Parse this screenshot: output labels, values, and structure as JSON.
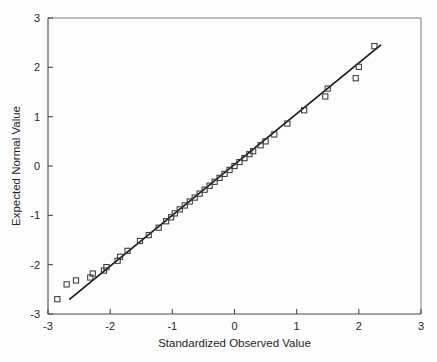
{
  "chart_data": {
    "type": "scatter",
    "title": "",
    "xlabel": "Standardized Observed Value",
    "ylabel": "Expected Normal Value",
    "xlim": [
      -3,
      3
    ],
    "ylim": [
      -3,
      3
    ],
    "xticks": [
      -3,
      -2,
      -1,
      0,
      1,
      2,
      3
    ],
    "yticks": [
      -3,
      -2,
      -1,
      0,
      1,
      2,
      3
    ],
    "xtick_labels": [
      "-3",
      "-2",
      "-1",
      "0",
      "1",
      "2",
      "3"
    ],
    "ytick_labels": [
      "-3",
      "-2",
      "-1",
      "0",
      "1",
      "2",
      "3"
    ],
    "grid": false,
    "legend": false,
    "legend_position": "none",
    "marker_style": "open-square",
    "marker_color": "#3a3a3a",
    "line_color": "#1a1a1a",
    "background_color": "#fdfdfe",
    "axis_color": "#4a4a4a",
    "reference_line": {
      "label": "normal reference line",
      "x": [
        -2.65,
        2.35
      ],
      "y": [
        -2.7,
        2.45
      ]
    },
    "series": [
      {
        "name": "Q-Q points",
        "x": [
          -2.85,
          -2.7,
          -2.55,
          -2.32,
          -2.28,
          -2.1,
          -2.06,
          -1.88,
          -1.84,
          -1.72,
          -1.52,
          -1.38,
          -1.22,
          -1.1,
          -1.02,
          -0.96,
          -0.88,
          -0.8,
          -0.72,
          -0.64,
          -0.56,
          -0.48,
          -0.4,
          -0.32,
          -0.24,
          -0.16,
          -0.08,
          0.0,
          0.08,
          0.16,
          0.24,
          0.3,
          0.42,
          0.5,
          0.64,
          0.85,
          1.12,
          1.46,
          1.5,
          1.95,
          2.0,
          2.25
        ],
        "y": [
          -2.7,
          -2.4,
          -2.32,
          -2.26,
          -2.18,
          -2.12,
          -2.05,
          -1.92,
          -1.84,
          -1.72,
          -1.52,
          -1.4,
          -1.25,
          -1.12,
          -1.04,
          -0.96,
          -0.88,
          -0.8,
          -0.72,
          -0.64,
          -0.56,
          -0.48,
          -0.4,
          -0.32,
          -0.24,
          -0.16,
          -0.08,
          0.0,
          0.08,
          0.16,
          0.24,
          0.3,
          0.42,
          0.5,
          0.64,
          0.86,
          1.13,
          1.41,
          1.57,
          1.78,
          2.01,
          2.43
        ]
      }
    ]
  },
  "figure": {
    "caption": ""
  }
}
